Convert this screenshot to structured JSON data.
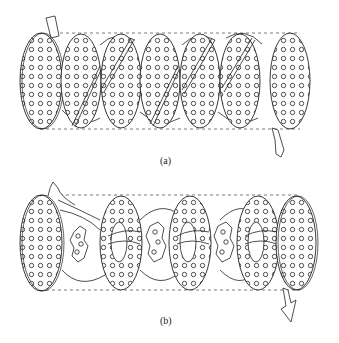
{
  "figure": {
    "panels": [
      {
        "id": "a",
        "label": "(a)",
        "description": "Shell with helical (segmental) baffles, inlet top-left, outlet bottom-right",
        "shell_top_y": 33,
        "shell_bottom_y": 129,
        "disks": [
          {
            "cx": 41,
            "type": "full"
          },
          {
            "cx": 81,
            "type": "cut"
          },
          {
            "cx": 121,
            "type": "cut"
          },
          {
            "cx": 160,
            "type": "cut"
          },
          {
            "cx": 200,
            "type": "cut"
          },
          {
            "cx": 240,
            "type": "cut"
          },
          {
            "cx": 290,
            "type": "full"
          }
        ]
      },
      {
        "id": "b",
        "label": "(b)",
        "description": "Shell with disc-and-doughnut baffles, inlet top-left, outlet bottom-right",
        "shell_top_y": 195,
        "shell_bottom_y": 290,
        "disks": [
          {
            "cx": 41,
            "type": "full"
          },
          {
            "cx": 81,
            "type": "disc"
          },
          {
            "cx": 121,
            "type": "doughnut"
          },
          {
            "cx": 160,
            "type": "disc"
          },
          {
            "cx": 200,
            "type": "doughnut"
          },
          {
            "cx": 240,
            "type": "disc"
          },
          {
            "cx": 262,
            "type": "doughnut"
          },
          {
            "cx": 300,
            "type": "full"
          }
        ]
      }
    ],
    "colors": {
      "line": "#222222",
      "background": "#ffffff"
    }
  }
}
